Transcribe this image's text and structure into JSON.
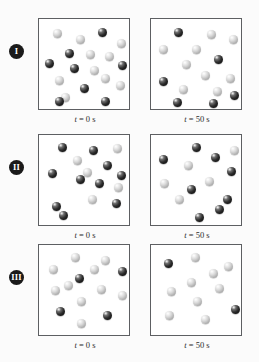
{
  "figure": {
    "title": "",
    "background_color": "#fbfbfb",
    "box_border_color": "#5d5f62",
    "box_fill_color": "#ffffff",
    "badge_color": "#1a1a1a",
    "badge_text_color": "#ffffff",
    "sphere_types": {
      "light": {
        "name": "light-gray-sphere",
        "color": "#d8d8d8"
      },
      "dark": {
        "name": "dark-sphere",
        "color": "#1a1a1a"
      }
    }
  },
  "rows": [
    {
      "label": "I",
      "label_name": "roman-numeral-one",
      "panels": [
        {
          "caption_var": "t",
          "caption_eq": "=",
          "caption_value": "0",
          "caption_unit": "s",
          "caption_full": "t = 0 s",
          "light_count": 11,
          "dark_count": 7,
          "total_count": 18,
          "spheres": [
            {
              "type": "light",
              "x": 14,
              "y": 10
            },
            {
              "type": "light",
              "x": 37,
              "y": 16
            },
            {
              "type": "dark",
              "x": 59,
              "y": 9
            },
            {
              "type": "light",
              "x": 78,
              "y": 20
            },
            {
              "type": "dark",
              "x": 26,
              "y": 30
            },
            {
              "type": "light",
              "x": 47,
              "y": 31
            },
            {
              "type": "light",
              "x": 66,
              "y": 33
            },
            {
              "type": "dark",
              "x": 6,
              "y": 40
            },
            {
              "type": "dark",
              "x": 31,
              "y": 45
            },
            {
              "type": "light",
              "x": 51,
              "y": 47
            },
            {
              "type": "dark",
              "x": 79,
              "y": 42
            },
            {
              "type": "light",
              "x": 16,
              "y": 57
            },
            {
              "type": "light",
              "x": 62,
              "y": 55
            },
            {
              "type": "dark",
              "x": 41,
              "y": 65
            },
            {
              "type": "light",
              "x": 77,
              "y": 62
            },
            {
              "type": "light",
              "x": 22,
              "y": 74
            },
            {
              "type": "dark",
              "x": 16,
              "y": 78
            },
            {
              "type": "dark",
              "x": 62,
              "y": 78
            }
          ]
        },
        {
          "caption_var": "t",
          "caption_eq": "=",
          "caption_value": "50",
          "caption_unit": "s",
          "caption_full": "t = 50 s",
          "light_count": 9,
          "dark_count": 6,
          "total_count": 15,
          "spheres": [
            {
              "type": "dark",
              "x": 23,
              "y": 9
            },
            {
              "type": "light",
              "x": 56,
              "y": 11
            },
            {
              "type": "light",
              "x": 78,
              "y": 16
            },
            {
              "type": "light",
              "x": 8,
              "y": 26
            },
            {
              "type": "light",
              "x": 41,
              "y": 26
            },
            {
              "type": "light",
              "x": 31,
              "y": 41
            },
            {
              "type": "dark",
              "x": 63,
              "y": 36
            },
            {
              "type": "light",
              "x": 50,
              "y": 52
            },
            {
              "type": "dark",
              "x": 8,
              "y": 58
            },
            {
              "type": "light",
              "x": 75,
              "y": 55
            },
            {
              "type": "light",
              "x": 28,
              "y": 66
            },
            {
              "type": "light",
              "x": 62,
              "y": 68
            },
            {
              "type": "dark",
              "x": 22,
              "y": 79
            },
            {
              "type": "dark",
              "x": 58,
              "y": 80
            },
            {
              "type": "dark",
              "x": 79,
              "y": 72
            }
          ]
        }
      ]
    },
    {
      "label": "II",
      "label_name": "roman-numeral-two",
      "panels": [
        {
          "caption_var": "t",
          "caption_eq": "=",
          "caption_value": "0",
          "caption_unit": "s",
          "caption_full": "t = 0 s",
          "light_count": 5,
          "dark_count": 10,
          "total_count": 15,
          "spheres": [
            {
              "type": "dark",
              "x": 19,
              "y": 8
            },
            {
              "type": "dark",
              "x": 50,
              "y": 11
            },
            {
              "type": "light",
              "x": 74,
              "y": 9
            },
            {
              "type": "light",
              "x": 34,
              "y": 21
            },
            {
              "type": "dark",
              "x": 64,
              "y": 26
            },
            {
              "type": "dark",
              "x": 9,
              "y": 34
            },
            {
              "type": "dark",
              "x": 78,
              "y": 36
            },
            {
              "type": "dark",
              "x": 37,
              "y": 40
            },
            {
              "type": "dark",
              "x": 56,
              "y": 44
            },
            {
              "type": "light",
              "x": 75,
              "y": 48
            },
            {
              "type": "light",
              "x": 49,
              "y": 60
            },
            {
              "type": "dark",
              "x": 13,
              "y": 67
            },
            {
              "type": "dark",
              "x": 73,
              "y": 64
            },
            {
              "type": "dark",
              "x": 20,
              "y": 76
            },
            {
              "type": "light",
              "x": 44,
              "y": 33
            }
          ]
        },
        {
          "caption_var": "t",
          "caption_eq": "=",
          "caption_value": "50",
          "caption_unit": "s",
          "caption_full": "t = 50 s",
          "light_count": 5,
          "dark_count": 8,
          "total_count": 13,
          "spheres": [
            {
              "type": "dark",
              "x": 41,
              "y": 8
            },
            {
              "type": "dark",
              "x": 8,
              "y": 20
            },
            {
              "type": "dark",
              "x": 60,
              "y": 18
            },
            {
              "type": "light",
              "x": 79,
              "y": 11
            },
            {
              "type": "light",
              "x": 33,
              "y": 26
            },
            {
              "type": "dark",
              "x": 76,
              "y": 32
            },
            {
              "type": "light",
              "x": 54,
              "y": 42
            },
            {
              "type": "light",
              "x": 9,
              "y": 44
            },
            {
              "type": "dark",
              "x": 36,
              "y": 50
            },
            {
              "type": "dark",
              "x": 72,
              "y": 60
            },
            {
              "type": "dark",
              "x": 64,
              "y": 70
            },
            {
              "type": "dark",
              "x": 44,
              "y": 78
            },
            {
              "type": "light",
              "x": 24,
              "y": 60
            }
          ]
        }
      ]
    },
    {
      "label": "III",
      "label_name": "roman-numeral-three",
      "panels": [
        {
          "caption_var": "t",
          "caption_eq": "=",
          "caption_value": "0",
          "caption_unit": "s",
          "caption_full": "t = 0 s",
          "light_count": 10,
          "dark_count": 4,
          "total_count": 14,
          "spheres": [
            {
              "type": "light",
              "x": 32,
              "y": 8
            },
            {
              "type": "light",
              "x": 62,
              "y": 11
            },
            {
              "type": "light",
              "x": 10,
              "y": 20
            },
            {
              "type": "dark",
              "x": 79,
              "y": 22
            },
            {
              "type": "dark",
              "x": 36,
              "y": 29
            },
            {
              "type": "light",
              "x": 58,
              "y": 40
            },
            {
              "type": "light",
              "x": 12,
              "y": 41
            },
            {
              "type": "light",
              "x": 79,
              "y": 46
            },
            {
              "type": "light",
              "x": 38,
              "y": 52
            },
            {
              "type": "dark",
              "x": 17,
              "y": 62
            },
            {
              "type": "dark",
              "x": 64,
              "y": 66
            },
            {
              "type": "light",
              "x": 38,
              "y": 74
            },
            {
              "type": "light",
              "x": 25,
              "y": 36
            },
            {
              "type": "light",
              "x": 51,
              "y": 20
            }
          ]
        },
        {
          "caption_var": "t",
          "caption_eq": "=",
          "caption_value": "50",
          "caption_unit": "s",
          "caption_full": "t = 50 s",
          "light_count": 9,
          "dark_count": 2,
          "total_count": 11,
          "spheres": [
            {
              "type": "dark",
              "x": 13,
              "y": 14
            },
            {
              "type": "light",
              "x": 40,
              "y": 8
            },
            {
              "type": "light",
              "x": 73,
              "y": 17
            },
            {
              "type": "light",
              "x": 36,
              "y": 33
            },
            {
              "type": "light",
              "x": 64,
              "y": 39
            },
            {
              "type": "light",
              "x": 16,
              "y": 42
            },
            {
              "type": "light",
              "x": 42,
              "y": 52
            },
            {
              "type": "dark",
              "x": 80,
              "y": 60
            },
            {
              "type": "light",
              "x": 14,
              "y": 66
            },
            {
              "type": "light",
              "x": 50,
              "y": 70
            },
            {
              "type": "light",
              "x": 58,
              "y": 24
            }
          ]
        }
      ]
    }
  ]
}
